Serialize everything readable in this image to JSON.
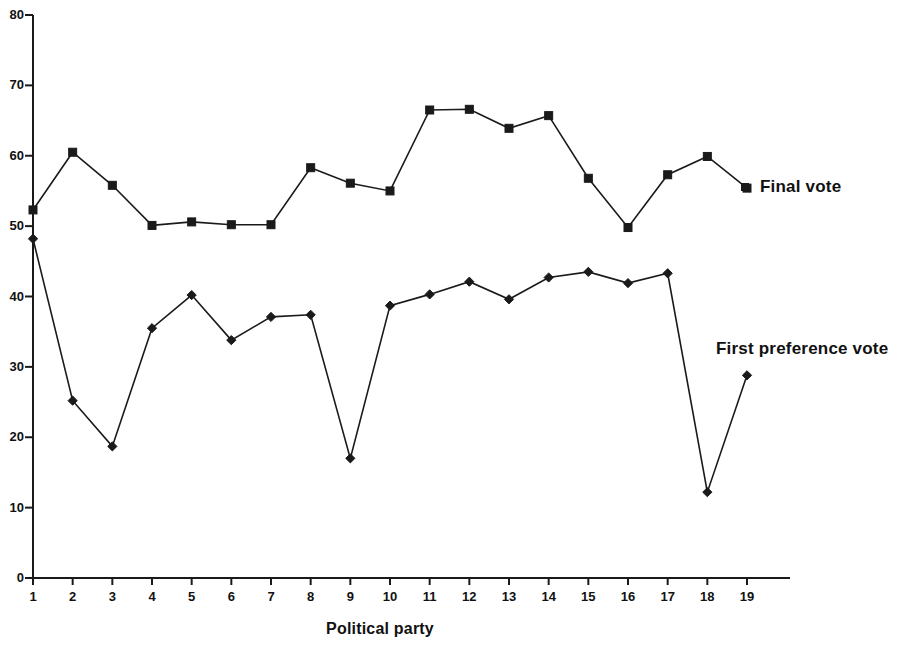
{
  "chart_data": {
    "type": "line",
    "title": "",
    "xlabel": "Political party",
    "ylabel": "",
    "xlim": [
      1,
      19
    ],
    "ylim": [
      0,
      80
    ],
    "ytick_values": [
      0,
      10,
      20,
      30,
      40,
      50,
      60,
      70,
      80
    ],
    "ytick_labels": [
      "0",
      "10",
      "20",
      "30",
      "40",
      "50",
      "60",
      "70",
      "80"
    ],
    "xtick_labels": [
      "1",
      "2",
      "3",
      "4",
      "5",
      "6",
      "7",
      "8",
      "9",
      "10",
      "11",
      "12",
      "13",
      "14",
      "15",
      "16",
      "17",
      "18",
      "19"
    ],
    "categories": [
      1,
      2,
      3,
      4,
      5,
      6,
      7,
      8,
      9,
      10,
      11,
      12,
      13,
      14,
      15,
      16,
      17,
      18,
      19
    ],
    "grid": false,
    "legend_position": "inline-right-annotations",
    "series": [
      {
        "name": "Final vote",
        "marker": "square",
        "color": "#1a1a1a",
        "values": [
          52.3,
          60.5,
          55.8,
          50.1,
          50.6,
          50.2,
          50.2,
          58.3,
          56.1,
          55.0,
          66.5,
          66.6,
          63.9,
          65.7,
          56.8,
          49.8,
          57.3,
          59.9,
          55.4
        ]
      },
      {
        "name": "First preference vote",
        "marker": "diamond",
        "color": "#1a1a1a",
        "values": [
          48.2,
          25.2,
          18.7,
          35.5,
          40.2,
          33.8,
          37.1,
          37.4,
          17.0,
          38.7,
          40.3,
          42.1,
          39.6,
          42.7,
          43.5,
          41.9,
          43.3,
          12.2,
          28.8
        ]
      }
    ],
    "annotations": [
      {
        "text": "Final vote",
        "series": "Final vote"
      },
      {
        "text": "First preference vote",
        "series": "First preference vote"
      }
    ]
  },
  "axis": {
    "x_title": "Political party",
    "y_title": ""
  },
  "legend": {
    "final_vote_label": "Final vote",
    "first_preference_label": "First preference vote"
  },
  "colors": {
    "line": "#1a1a1a",
    "axis": "#1a1a1a",
    "background": "#ffffff"
  }
}
